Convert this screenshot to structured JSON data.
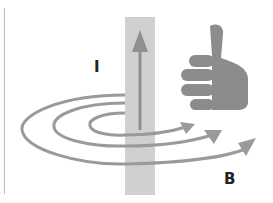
{
  "diagram": {
    "labels": {
      "current": "I",
      "field": "B"
    },
    "icons": {
      "hand": "thumbs-up-icon",
      "current_arrow": "arrow-up-icon",
      "field_loops": "curved-arrow-icon"
    },
    "colors": {
      "conductor": "#cfcfcf",
      "arrow": "#8f8f8f",
      "hand": "#8c8c8c",
      "label": "#222222"
    }
  }
}
